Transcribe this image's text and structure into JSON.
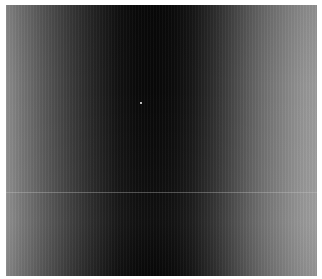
{
  "image": {
    "description": "Grayscale intensity image with vertical banding: bright edges fading to a dark central column",
    "colors": {
      "border": "#ffffff",
      "edge_gray": "#8e8e8e",
      "center_dark": "#080808",
      "speck": "#bdbdbd"
    }
  }
}
